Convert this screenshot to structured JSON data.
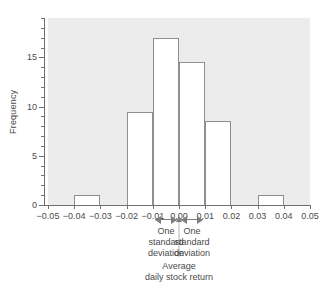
{
  "chart_data": {
    "type": "bar",
    "title": "",
    "subtitle": "",
    "xlabel_line1": "Average",
    "xlabel_line2": "daily stock return",
    "ylabel": "Frequency",
    "grid": false,
    "legend": "none",
    "xlim": [
      -0.05,
      0.05
    ],
    "ylim": [
      0,
      19
    ],
    "bin_width": 0.01,
    "x_tick_labels": [
      "−0.05",
      "−0.04",
      "−0.03",
      "−0.02",
      "−0.01",
      "0.00",
      "0.01",
      "0.02",
      "0.03",
      "0.04",
      "0.05"
    ],
    "x_tick_values": [
      -0.05,
      -0.04,
      -0.03,
      -0.02,
      -0.01,
      0.0,
      0.01,
      0.02,
      0.03,
      0.04,
      0.05
    ],
    "y_tick_labels": [
      "0",
      "5",
      "10",
      "15"
    ],
    "y_tick_values": [
      0,
      5,
      10,
      15
    ],
    "y_minor_step": 1,
    "bins": [
      {
        "left": -0.05,
        "right": -0.04,
        "value": 0
      },
      {
        "left": -0.04,
        "right": -0.03,
        "value": 1
      },
      {
        "left": -0.03,
        "right": -0.02,
        "value": 0
      },
      {
        "left": -0.02,
        "right": -0.01,
        "value": 9.5
      },
      {
        "left": -0.01,
        "right": 0.0,
        "value": 17
      },
      {
        "left": 0.0,
        "right": 0.01,
        "value": 14.5
      },
      {
        "left": 0.01,
        "right": 0.02,
        "value": 8.5
      },
      {
        "left": 0.02,
        "right": 0.03,
        "value": 0
      },
      {
        "left": 0.03,
        "right": 0.04,
        "value": 1
      },
      {
        "left": 0.04,
        "right": 0.05,
        "value": 0
      }
    ],
    "categories": [
      "-0.05 to -0.04",
      "-0.04 to -0.03",
      "-0.03 to -0.02",
      "-0.02 to -0.01",
      "-0.01 to 0.00",
      "0.00 to 0.01",
      "0.01 to 0.02",
      "0.02 to 0.03",
      "0.03 to 0.04",
      "0.04 to 0.05"
    ],
    "values": [
      0,
      1,
      0,
      9.5,
      17,
      14.5,
      8.5,
      0,
      1,
      0
    ],
    "annotations": {
      "mean_x": 0.0,
      "sd": 0.01,
      "left_span": [
        -0.01,
        0.0
      ],
      "right_span": [
        0.0,
        0.01
      ],
      "left_label_line1": "One",
      "left_label_line2": "standard",
      "left_label_line3": "deviation",
      "right_label_line1": "One",
      "right_label_line2": "standard",
      "right_label_line3": "deviation"
    },
    "colors": {
      "plot_background": "#ececed",
      "bar_fill": "#ffffff",
      "bar_edge": "#8e8e8e",
      "axis": "#6f6f6f",
      "text": "#4a4a4a",
      "annotation": "#7d7d7d",
      "page_background": "#ffffff"
    }
  }
}
